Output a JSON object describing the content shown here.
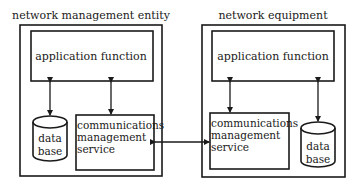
{
  "diagram": {
    "left_entity": {
      "title": "network management entity",
      "application": "application function",
      "database": [
        "data",
        "base"
      ],
      "comms": [
        "communications",
        "management",
        "service"
      ]
    },
    "right_entity": {
      "title": "network equipment",
      "application": "application function",
      "database": [
        "data",
        "base"
      ],
      "comms": [
        "communications",
        "management",
        "service"
      ]
    },
    "connections": [
      {
        "from": "left.application",
        "to": "left.database",
        "type": "bidirectional"
      },
      {
        "from": "left.application",
        "to": "left.comms",
        "type": "bidirectional"
      },
      {
        "from": "left.comms",
        "to": "right.comms",
        "type": "bidirectional"
      },
      {
        "from": "right.application",
        "to": "right.comms",
        "type": "bidirectional"
      },
      {
        "from": "right.application",
        "to": "right.database",
        "type": "bidirectional"
      }
    ]
  }
}
